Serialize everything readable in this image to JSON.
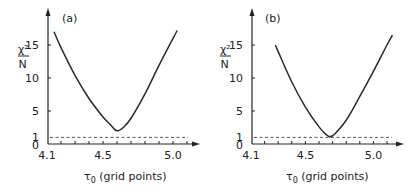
{
  "chart_data": [
    {
      "type": "line",
      "panel_label": "(a)",
      "xlabel": "τ0 (grid points)",
      "xlabel_main": "τ",
      "xlabel_sub": "0",
      "xlabel_rest": " (grid points)",
      "ylabel_num": "χ²",
      "ylabel_den": "N",
      "xlim": [
        4.1,
        5.15
      ],
      "ylim": [
        0,
        18
      ],
      "x_ticks": [
        4.1,
        4.5,
        5.0
      ],
      "x_tick_labels": [
        "4.1",
        "4.5",
        "5.0"
      ],
      "x_minor_step": 0.1,
      "y_ticks": [
        0,
        1,
        5,
        10,
        15
      ],
      "y_tick_labels": [
        "0",
        "1",
        "5",
        "10",
        "15"
      ],
      "reference_line": {
        "y": 1,
        "style": "dashed"
      },
      "series": [
        {
          "name": "chi2_over_N",
          "x": [
            4.15,
            4.2,
            4.3,
            4.4,
            4.5,
            4.55,
            4.6,
            4.65,
            4.7,
            4.8,
            4.9,
            5.0,
            5.03
          ],
          "y": [
            17.0,
            14.6,
            10.4,
            6.9,
            4.1,
            3.0,
            2.0,
            2.6,
            3.9,
            7.6,
            11.9,
            16.0,
            17.2
          ]
        }
      ],
      "minimum": {
        "x": 4.6,
        "y": 2.0
      },
      "grid": false
    },
    {
      "type": "line",
      "panel_label": "(b)",
      "xlabel": "τ0 (grid points)",
      "xlabel_main": "τ",
      "xlabel_sub": "0",
      "xlabel_rest": " (grid points)",
      "ylabel_num": "χ²",
      "ylabel_den": "N",
      "xlim": [
        4.1,
        5.2
      ],
      "ylim": [
        0,
        18
      ],
      "x_ticks": [
        4.1,
        4.5,
        5.0
      ],
      "x_tick_labels": [
        "4.1",
        "4.5",
        "5.0"
      ],
      "x_minor_step": 0.1,
      "y_ticks": [
        0,
        1,
        5,
        10,
        15
      ],
      "y_tick_labels": [
        "0",
        "1",
        "5",
        "10",
        "15"
      ],
      "reference_line": {
        "y": 1,
        "style": "dashed"
      },
      "series": [
        {
          "name": "chi2_over_N",
          "x": [
            4.28,
            4.3,
            4.4,
            4.5,
            4.6,
            4.65,
            4.68,
            4.72,
            4.8,
            4.9,
            5.0,
            5.1,
            5.14
          ],
          "y": [
            15.0,
            14.0,
            9.4,
            5.6,
            2.6,
            1.5,
            1.1,
            1.6,
            3.6,
            7.2,
            11.0,
            15.0,
            16.5
          ]
        }
      ],
      "minimum": {
        "x": 4.68,
        "y": 1.1
      },
      "grid": false
    }
  ]
}
